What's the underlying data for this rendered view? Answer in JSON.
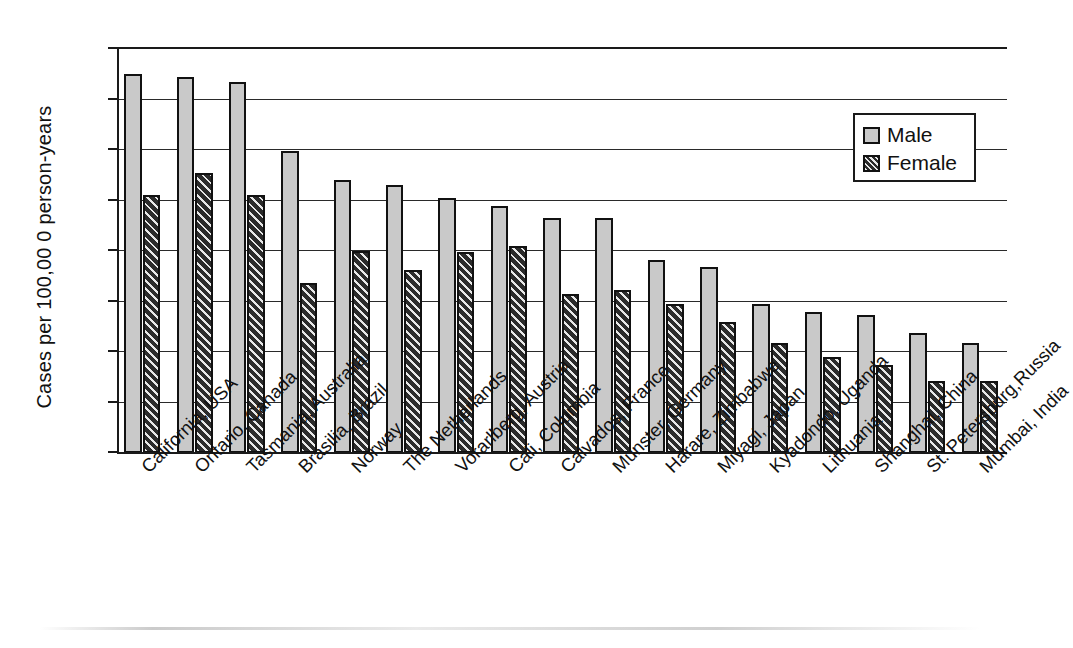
{
  "chart_data": {
    "type": "bar",
    "title": "",
    "xlabel": "",
    "ylabel": "Cases per 100,00 0 person-years",
    "ylim": [
      0,
      16
    ],
    "yticks": [
      0,
      2,
      4,
      6,
      8,
      10,
      12,
      14,
      16
    ],
    "grid": true,
    "legend_position": "top-right",
    "categories": [
      "California, USA",
      "Ontario, Canada",
      "Tasmania, Australia",
      "Brasilia, Brazil",
      "Norway",
      "The Netherlands",
      "Vorarlberg, Austria",
      "Cali, Columbia",
      "Calvados, France",
      "Munster, Germany",
      "Harare, Zimbabwe",
      "Miyagi, Japan",
      "Kyadondo, Uganda",
      "Lithuania",
      "Shanghai, China",
      "St. Petersburg,Russia",
      "Mumbai, India"
    ],
    "series": [
      {
        "name": "Male",
        "color": "#c9c9c9",
        "values": [
          15.0,
          14.9,
          14.7,
          11.95,
          10.8,
          10.6,
          10.1,
          9.8,
          9.3,
          9.3,
          7.65,
          7.35,
          5.9,
          5.6,
          5.45,
          4.75,
          4.35
        ]
      },
      {
        "name": "Female",
        "color": "#2b2b2b",
        "values": [
          10.2,
          11.1,
          10.2,
          6.75,
          8.0,
          7.25,
          7.95,
          8.2,
          6.3,
          6.45,
          5.9,
          5.2,
          4.35,
          3.8,
          3.5,
          2.85,
          2.85
        ]
      }
    ]
  },
  "legend": {
    "items": [
      {
        "label": "Male"
      },
      {
        "label": "Female"
      }
    ]
  }
}
